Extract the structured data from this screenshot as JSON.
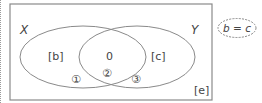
{
  "diagram": {
    "type": "venn",
    "universe_label": "[e]",
    "sets": [
      {
        "name": "X",
        "region_label": "[b]"
      },
      {
        "name": "Y",
        "region_label": "[c]"
      }
    ],
    "intersection_label": "0",
    "markers": [
      "①",
      "②",
      "③"
    ],
    "condition": "b = c"
  },
  "colors": {
    "stroke": "#8a8a8a",
    "text": "#444444"
  }
}
